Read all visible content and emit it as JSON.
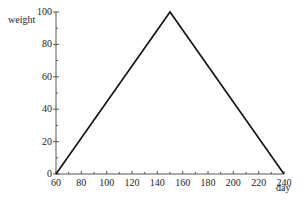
{
  "chart_data": {
    "type": "line",
    "title": "",
    "xlabel": "day",
    "ylabel": "weight",
    "xlim": [
      60,
      240
    ],
    "ylim": [
      0,
      100
    ],
    "x_ticks": [
      60,
      80,
      100,
      120,
      140,
      160,
      180,
      200,
      220,
      240
    ],
    "y_ticks": [
      0,
      20,
      40,
      60,
      80,
      100
    ],
    "grid": false,
    "legend": null,
    "series": [
      {
        "name": "weight",
        "x": [
          60,
          150,
          240
        ],
        "y": [
          0,
          100,
          0
        ],
        "color": "#111111"
      }
    ]
  }
}
